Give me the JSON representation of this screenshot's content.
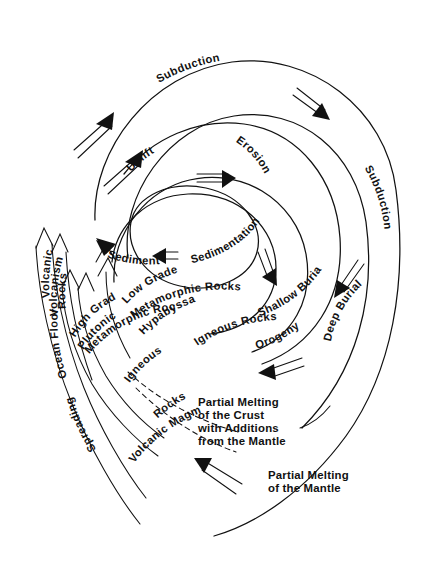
{
  "diagram": {
    "ink_color": "#111111",
    "background_color": "#ffffff"
  },
  "labels": {
    "subduction_top": "Subduction",
    "subduction_right": "Subduction",
    "uplift": "Uplift",
    "erosion": "Erosion",
    "sedimentation": "Sedimentation",
    "sediments": "Sediments",
    "shallow_burial": "Shallow Burial",
    "deep_burial": "Deep Burial",
    "orogeny": "Orogeny",
    "low_grade": "Low Grade",
    "metamorphic_rocks": "Metamorphic Rocks",
    "hypabyssal": "Hypabyssal",
    "igneous_rocks": "Igneous Rocks",
    "high_grade": "High Grade",
    "metamorphic_rocks_2": "Metamorphic Rocks",
    "plutonic": "Plutonic",
    "igneous": "Igneous",
    "rocks_dashed": "Rocks",
    "volcanic": "Volcanic",
    "rocks_left": "Rocks",
    "volcanism": "Volcanism",
    "ocean_floor": "Ocean Floor",
    "spreading": "Spreading",
    "volcanic_magma": "Volcanic Magma"
  },
  "text_blocks": {
    "partial_melting_crust": {
      "lines": [
        "Partial Melting",
        "of the Crust",
        "with Additions",
        "from the Mantle"
      ]
    },
    "partial_melting_mantle": {
      "lines": [
        "Partial Melting",
        "of the Mantle"
      ]
    }
  },
  "icons": {
    "arrow_double_uplift_a": "double-line-arrow-up-right-icon",
    "arrow_double_uplift_b": "double-line-arrow-up-right-icon",
    "arrow_double_subduction": "double-line-arrow-down-right-icon",
    "arrow_double_uplift_inner": "double-line-arrow-right-icon",
    "arrow_double_erosion": "double-line-arrow-down-icon",
    "arrow_double_sediments": "double-line-arrow-left-icon",
    "arrow_double_deepburial": "double-line-arrow-down-left-icon",
    "arrow_double_orogeny": "double-line-arrow-left-icon",
    "arrow_double_mantle": "double-line-arrow-up-left-icon",
    "arrowhead_volcanic_rocks": "arrowhead-up-icon",
    "arrowhead_volcanism": "arrowhead-up-icon",
    "arrowhead_low_grade": "arrowhead-up-icon",
    "arrowhead_high_grade": "arrowhead-up-icon",
    "arrowhead_sediments_band": "arrowhead-up-left-icon"
  }
}
